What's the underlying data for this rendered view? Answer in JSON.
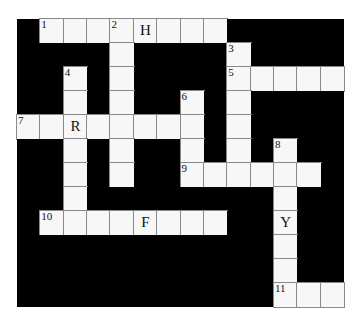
{
  "puzzle": {
    "cols": 14,
    "rows": 12,
    "colors": {
      "block": "#000000",
      "cell": "#f7f7f7",
      "grid_line": "#8a8a8a",
      "text": "#111111"
    },
    "entries": [
      {
        "number": 1,
        "direction": "across",
        "row": 0,
        "col": 1,
        "length": 8
      },
      {
        "number": 2,
        "direction": "down",
        "row": 0,
        "col": 4,
        "length": 7
      },
      {
        "number": 3,
        "direction": "down",
        "row": 1,
        "col": 9,
        "length": 6
      },
      {
        "number": 4,
        "direction": "down",
        "row": 2,
        "col": 2,
        "length": 7
      },
      {
        "number": 5,
        "direction": "across",
        "row": 2,
        "col": 9,
        "length": 5
      },
      {
        "number": 6,
        "direction": "down",
        "row": 3,
        "col": 7,
        "length": 4
      },
      {
        "number": 7,
        "direction": "across",
        "row": 4,
        "col": 0,
        "length": 8
      },
      {
        "number": 8,
        "direction": "down",
        "row": 5,
        "col": 11,
        "length": 7
      },
      {
        "number": 9,
        "direction": "across",
        "row": 6,
        "col": 7,
        "length": 6
      },
      {
        "number": 10,
        "direction": "across",
        "row": 8,
        "col": 1,
        "length": 8
      },
      {
        "number": 11,
        "direction": "across",
        "row": 11,
        "col": 11,
        "length": 3
      }
    ],
    "given_letters": [
      {
        "row": 0,
        "col": 5,
        "letter": "H"
      },
      {
        "row": 4,
        "col": 2,
        "letter": "R"
      },
      {
        "row": 8,
        "col": 11,
        "letter": "Y"
      },
      {
        "row": 8,
        "col": 5,
        "letter": "F"
      }
    ]
  }
}
